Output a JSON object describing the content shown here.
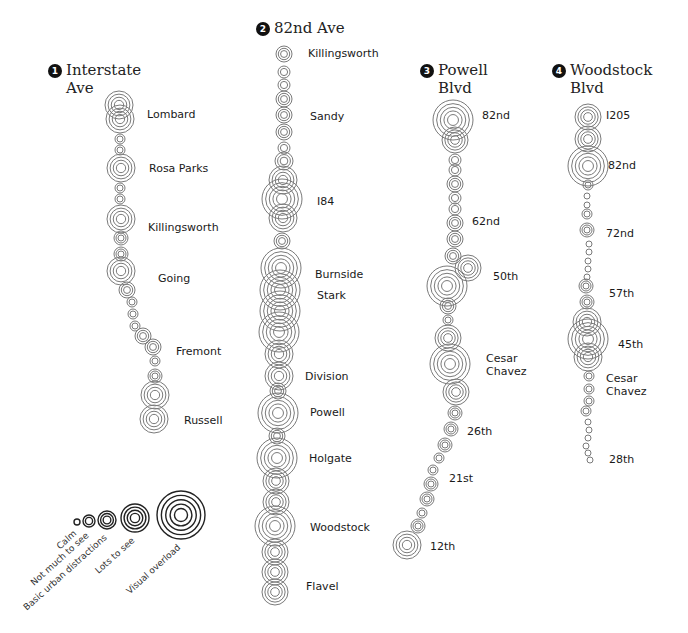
{
  "routes": [
    {
      "number": "1",
      "title_line1": "Interstate",
      "title_line2": "Ave",
      "title_pos": [
        48,
        61
      ],
      "stops": [
        {
          "label": "Lombard",
          "x": 147,
          "y": 108
        },
        {
          "label": "Rosa Parks",
          "x": 149,
          "y": 162
        },
        {
          "label": "Killingsworth",
          "x": 148,
          "y": 221
        },
        {
          "label": "Going",
          "x": 158,
          "y": 272
        },
        {
          "label": "Fremont",
          "x": 176,
          "y": 345
        },
        {
          "label": "Russell",
          "x": 184,
          "y": 414
        }
      ],
      "circles": [
        [
          119,
          105,
          14
        ],
        [
          120,
          119,
          14
        ],
        [
          120,
          139,
          5
        ],
        [
          120,
          150,
          5
        ],
        [
          121,
          168,
          14
        ],
        [
          120,
          188,
          5
        ],
        [
          120,
          199,
          5
        ],
        [
          121,
          219,
          14
        ],
        [
          121,
          238,
          7
        ],
        [
          121,
          254,
          7
        ],
        [
          121,
          271,
          14
        ],
        [
          127,
          290,
          8
        ],
        [
          132,
          302,
          5
        ],
        [
          133,
          314,
          5
        ],
        [
          135,
          326,
          5
        ],
        [
          143,
          336,
          8
        ],
        [
          153,
          347,
          8
        ],
        [
          155,
          361,
          5
        ],
        [
          155,
          376,
          7
        ],
        [
          155,
          395,
          14
        ],
        [
          154,
          419,
          14
        ]
      ]
    },
    {
      "number": "2",
      "title_line1": "82nd Ave",
      "title_line2": "",
      "title_pos": [
        256,
        19
      ],
      "stops": [
        {
          "label": "Killingsworth",
          "x": 308,
          "y": 47
        },
        {
          "label": "Sandy",
          "x": 310,
          "y": 110
        },
        {
          "label": "I84",
          "x": 317,
          "y": 195
        },
        {
          "label": "Burnside",
          "x": 315,
          "y": 268
        },
        {
          "label": "Stark",
          "x": 317,
          "y": 289
        },
        {
          "label": "Division",
          "x": 305,
          "y": 370
        },
        {
          "label": "Powell",
          "x": 310,
          "y": 406
        },
        {
          "label": "Holgate",
          "x": 309,
          "y": 452
        },
        {
          "label": "Woodstock",
          "x": 310,
          "y": 521
        },
        {
          "label": "Flavel",
          "x": 306,
          "y": 580
        }
      ],
      "circles": [
        [
          284,
          54,
          8
        ],
        [
          284,
          72,
          6
        ],
        [
          284,
          85,
          6
        ],
        [
          284,
          99,
          8
        ],
        [
          284,
          115,
          8
        ],
        [
          284,
          132,
          8
        ],
        [
          284,
          148,
          6
        ],
        [
          284,
          161,
          9
        ],
        [
          283,
          180,
          14
        ],
        [
          282,
          199,
          20
        ],
        [
          283,
          218,
          14
        ],
        [
          282,
          241,
          8
        ],
        [
          281,
          268,
          20
        ],
        [
          280,
          290,
          20
        ],
        [
          280,
          311,
          20
        ],
        [
          279,
          332,
          20
        ],
        [
          279,
          354,
          14
        ],
        [
          279,
          376,
          14
        ],
        [
          278,
          391,
          8
        ],
        [
          278,
          413,
          20
        ],
        [
          277,
          436,
          8
        ],
        [
          277,
          458,
          20
        ],
        [
          276,
          481,
          13
        ],
        [
          276,
          502,
          13
        ],
        [
          275,
          526,
          20
        ],
        [
          275,
          552,
          13
        ],
        [
          275,
          572,
          13
        ],
        [
          275,
          592,
          13
        ]
      ]
    },
    {
      "number": "3",
      "title_line1": "Powell",
      "title_line2": "Blvd",
      "title_pos": [
        420,
        61
      ],
      "stops": [
        {
          "label": "82nd",
          "x": 482,
          "y": 109
        },
        {
          "label": "62nd",
          "x": 472,
          "y": 215
        },
        {
          "label": "50th",
          "x": 493,
          "y": 270
        },
        {
          "label": "Cesar\nChavez",
          "x": 486,
          "y": 352
        },
        {
          "label": "26th",
          "x": 467,
          "y": 425
        },
        {
          "label": "21st",
          "x": 449,
          "y": 472
        },
        {
          "label": "12th",
          "x": 430,
          "y": 540
        }
      ],
      "circles": [
        [
          453,
          120,
          20
        ],
        [
          455,
          140,
          13
        ],
        [
          455,
          160,
          6
        ],
        [
          455,
          170,
          6
        ],
        [
          455,
          184,
          8
        ],
        [
          455,
          198,
          6
        ],
        [
          455,
          209,
          6
        ],
        [
          455,
          223,
          8
        ],
        [
          455,
          239,
          8
        ],
        [
          453,
          256,
          8
        ],
        [
          468,
          268,
          13
        ],
        [
          447,
          286,
          20
        ],
        [
          448,
          306,
          8
        ],
        [
          448,
          320,
          5
        ],
        [
          448,
          338,
          13
        ],
        [
          450,
          364,
          20
        ],
        [
          456,
          392,
          13
        ],
        [
          455,
          413,
          7
        ],
        [
          451,
          429,
          7
        ],
        [
          445,
          445,
          7
        ],
        [
          439,
          458,
          5
        ],
        [
          433,
          470,
          5
        ],
        [
          431,
          484,
          7
        ],
        [
          427,
          499,
          7
        ],
        [
          422,
          513,
          5
        ],
        [
          418,
          526,
          7
        ],
        [
          407,
          545,
          14
        ]
      ]
    },
    {
      "number": "4",
      "title_line1": "Woodstock",
      "title_line2": "Blvd",
      "title_pos": [
        552,
        61
      ],
      "stops": [
        {
          "label": "I205",
          "x": 606,
          "y": 109
        },
        {
          "label": "82nd",
          "x": 608,
          "y": 159
        },
        {
          "label": "72nd",
          "x": 606,
          "y": 227
        },
        {
          "label": "57th",
          "x": 609,
          "y": 287
        },
        {
          "label": "45th",
          "x": 618,
          "y": 338
        },
        {
          "label": "Cesar\nChavez",
          "x": 606,
          "y": 372
        },
        {
          "label": "28th",
          "x": 609,
          "y": 453
        }
      ],
      "circles": [
        [
          588,
          117,
          13
        ],
        [
          588,
          139,
          13
        ],
        [
          588,
          166,
          20
        ],
        [
          588,
          185,
          5
        ],
        [
          587,
          196,
          3
        ],
        [
          587,
          205,
          3
        ],
        [
          587,
          214,
          5
        ],
        [
          587,
          230,
          7
        ],
        [
          589,
          244,
          3
        ],
        [
          589,
          252,
          3
        ],
        [
          588,
          261,
          3
        ],
        [
          588,
          269,
          3
        ],
        [
          587,
          277,
          3
        ],
        [
          586,
          286,
          7
        ],
        [
          587,
          302,
          7
        ],
        [
          587,
          322,
          14
        ],
        [
          588,
          339,
          20
        ],
        [
          588,
          357,
          14
        ],
        [
          589,
          376,
          5
        ],
        [
          589,
          389,
          5
        ],
        [
          589,
          401,
          5
        ],
        [
          586,
          411,
          5
        ],
        [
          588,
          422,
          3
        ],
        [
          589,
          430,
          3
        ],
        [
          588,
          438,
          3
        ],
        [
          586,
          446,
          3
        ],
        [
          588,
          453,
          3
        ],
        [
          590,
          460,
          3
        ]
      ]
    }
  ],
  "legend": {
    "levels": [
      {
        "label": "Calm",
        "cx": 77,
        "cy": 522,
        "r": 3
      },
      {
        "label": "Not much to see",
        "cx": 89,
        "cy": 521,
        "r": 6
      },
      {
        "label": "Basic urban distractions",
        "cx": 107,
        "cy": 520,
        "r": 9
      },
      {
        "label": "Lots to see",
        "cx": 135,
        "cy": 518,
        "r": 14
      },
      {
        "label": "Visual overload",
        "cx": 181,
        "cy": 515,
        "r": 24
      }
    ]
  },
  "colors": {
    "route_circle": "#7a7a7a",
    "legend_circle": "#222222",
    "text": "#1a1a1a",
    "badge": "#111111"
  }
}
